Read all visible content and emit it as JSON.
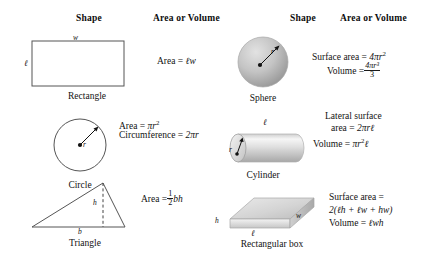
{
  "table": {
    "columns": [
      {
        "header": "Shape"
      },
      {
        "header": "Area or Volume"
      },
      {
        "header": "Shape"
      },
      {
        "header": "Area or Volume"
      }
    ]
  },
  "left_column": {
    "rows": [
      {
        "caption": "Rectangle",
        "shape": "rectangle-2d",
        "dim_labels": {
          "top": "w",
          "left": "ℓ"
        },
        "formulas": [
          {
            "text": "Area = ℓw",
            "parts": {
              "lhs": "Area",
              "eq": "=",
              "rhs": "ℓw"
            }
          }
        ]
      },
      {
        "caption": "Circle",
        "shape": "circle-2d",
        "dim_labels": {
          "radius": "r"
        },
        "formulas": [
          {
            "text": "Area = πr²",
            "parts": {
              "lhs": "Area",
              "eq": "=",
              "rhs": "πr",
              "exp": "2"
            }
          },
          {
            "text": "Circumference = 2πr",
            "parts": {
              "lhs": "Circumference",
              "eq": "=",
              "rhs": "2πr"
            }
          }
        ]
      },
      {
        "caption": "Triangle",
        "shape": "triangle-2d",
        "dim_labels": {
          "base": "b",
          "height": "h"
        },
        "formulas": [
          {
            "text": "Area = ½bh",
            "parts": {
              "lhs": "Area",
              "eq": "=",
              "frac_num": "1",
              "frac_den": "2",
              "rhs": "bh"
            }
          }
        ]
      }
    ]
  },
  "right_column": {
    "rows": [
      {
        "caption": "Sphere",
        "shape": "sphere-3d",
        "dim_labels": {
          "radius": "r"
        },
        "formulas": [
          {
            "text": "Surface area = 4πr²",
            "parts": {
              "lhs": "Surface area",
              "eq": "=",
              "rhs": "4πr",
              "exp": "2"
            }
          },
          {
            "text": "Volume = 4πr³/3",
            "parts": {
              "lhs": "Volume",
              "eq": "=",
              "frac_num": "4πr³",
              "frac_den": "3"
            }
          }
        ]
      },
      {
        "caption": "Cylinder",
        "shape": "cylinder-3d",
        "dim_labels": {
          "length": "ℓ",
          "radius": "r"
        },
        "formulas": [
          {
            "text": "Lateral surface",
            "parts": {
              "lhs": "Lateral surface"
            }
          },
          {
            "text": "area = 2πrℓ",
            "parts": {
              "lhs": "area",
              "eq": "=",
              "rhs": "2πrℓ"
            }
          },
          {
            "text": "Volume = πr²ℓ",
            "parts": {
              "lhs": "Volume",
              "eq": "=",
              "rhs": "πr",
              "exp": "2",
              "tail": "ℓ"
            }
          }
        ]
      },
      {
        "caption": "Rectangular box",
        "shape": "rectangular-box-3d",
        "dim_labels": {
          "height": "h",
          "length": "ℓ",
          "width": "w"
        },
        "formulas": [
          {
            "text": "Surface area =",
            "parts": {
              "lhs": "Surface area",
              "eq": "="
            }
          },
          {
            "text": "2(ℓh + ℓw + hw)",
            "parts": {
              "rhs": "2(ℓh + ℓw + hw)"
            }
          },
          {
            "text": "Volume = ℓwh",
            "parts": {
              "lhs": "Volume",
              "eq": "=",
              "rhs": "ℓwh"
            }
          }
        ]
      }
    ]
  },
  "colors": {
    "background": "#ffffff",
    "ink": "#121212",
    "line": "#4a4a4a",
    "shade_light": "#f2f2f2",
    "shade_mid": "#c9c9c9",
    "shade_dark": "#9a9a9a"
  }
}
